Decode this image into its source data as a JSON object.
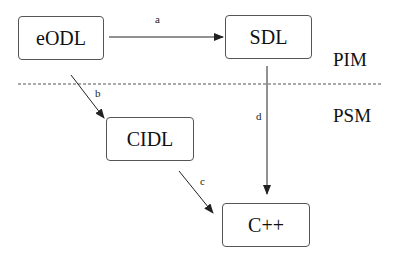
{
  "diagram": {
    "nodes": [
      {
        "id": "eodl",
        "label": "eODL"
      },
      {
        "id": "sdl",
        "label": "SDL"
      },
      {
        "id": "cidl",
        "label": "CIDL"
      },
      {
        "id": "cpp",
        "label": "C++"
      }
    ],
    "edges": [
      {
        "from": "eodl",
        "to": "sdl",
        "label": "a"
      },
      {
        "from": "eodl",
        "to": "cidl",
        "label": "b"
      },
      {
        "from": "cidl",
        "to": "cpp",
        "label": "c"
      },
      {
        "from": "sdl",
        "to": "cpp",
        "label": "d"
      }
    ],
    "zones": [
      {
        "label": "PIM"
      },
      {
        "label": "PSM"
      }
    ],
    "colors": {
      "stroke": "#222222",
      "box_border": "#555555",
      "background": "#ffffff"
    }
  }
}
